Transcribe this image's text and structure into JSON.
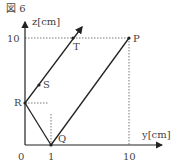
{
  "figure": {
    "title": "図 6",
    "axes": {
      "y_label": "y[cm]",
      "z_label": "z[cm]",
      "origin_label": "0",
      "y_ticks": [
        "1",
        "10"
      ],
      "z_ticks": [
        "10"
      ]
    },
    "points": {
      "P": "P",
      "Q": "Q",
      "R": "R",
      "S": "S",
      "T": "T"
    }
  }
}
